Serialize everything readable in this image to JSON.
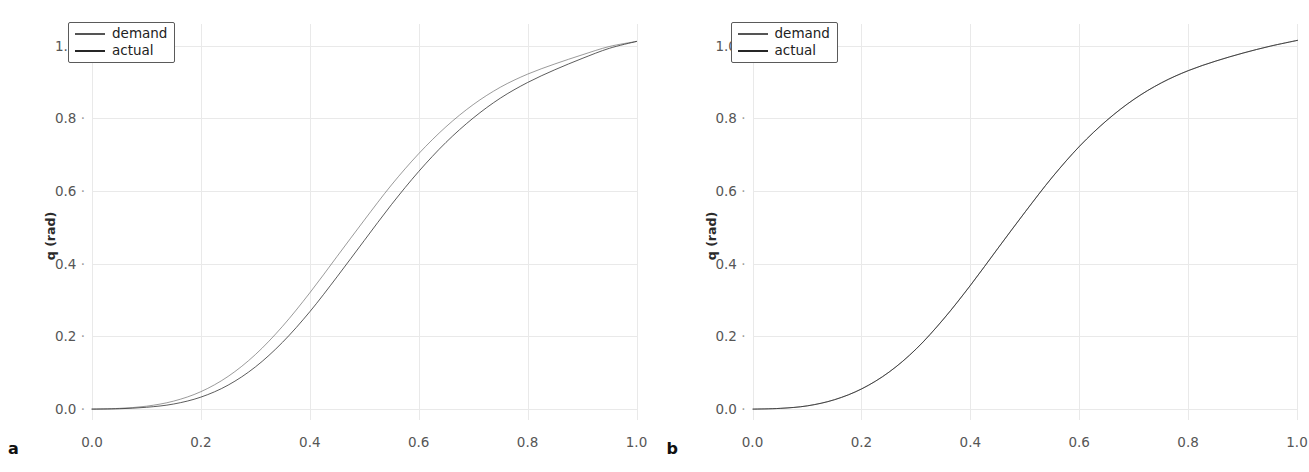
{
  "figure": {
    "clipped_header_text": "",
    "panels": [
      {
        "tag": "a",
        "ylabel": "q (rad)",
        "legend": [
          {
            "label": "demand",
            "color": "#555555",
            "width": 2.0
          },
          {
            "label": "actual",
            "color": "#262626",
            "width": 2.6
          }
        ],
        "yticks": [
          "0.0",
          "0.2",
          "0.4",
          "0.6",
          "0.8",
          "1.0"
        ],
        "xticks": [
          "0.0",
          "0.2",
          "0.4",
          "0.6",
          "0.8",
          "1.0"
        ]
      },
      {
        "tag": "b",
        "ylabel": "q (rad)",
        "legend": [
          {
            "label": "demand",
            "color": "#555555",
            "width": 2.0
          },
          {
            "label": "actual",
            "color": "#262626",
            "width": 2.6
          }
        ],
        "yticks": [
          "0.0",
          "0.2",
          "0.4",
          "0.6",
          "0.8",
          "1.0"
        ],
        "xticks": [
          "0.0",
          "0.2",
          "0.4",
          "0.6",
          "0.8",
          "1.0"
        ]
      }
    ]
  },
  "chart_data": [
    {
      "type": "line",
      "title": "",
      "panel": "a",
      "xlabel": "",
      "ylabel": "q (rad)",
      "xlim": [
        0.0,
        1.0
      ],
      "ylim": [
        -0.03,
        1.06
      ],
      "grid": true,
      "legend_position": "upper-left",
      "xticks": [
        0.0,
        0.2,
        0.4,
        0.6,
        0.8,
        1.0
      ],
      "yticks": [
        0.0,
        0.2,
        0.4,
        0.6,
        0.8,
        1.0
      ],
      "x": [
        0.0,
        0.05,
        0.1,
        0.15,
        0.2,
        0.25,
        0.3,
        0.35,
        0.4,
        0.45,
        0.5,
        0.55,
        0.6,
        0.65,
        0.7,
        0.75,
        0.8,
        0.85,
        0.9,
        0.95,
        1.0
      ],
      "series": [
        {
          "name": "demand",
          "color": "#555555",
          "values": [
            0.0,
            0.002,
            0.008,
            0.022,
            0.048,
            0.09,
            0.15,
            0.228,
            0.32,
            0.42,
            0.52,
            0.617,
            0.703,
            0.777,
            0.838,
            0.886,
            0.922,
            0.95,
            0.975,
            0.998,
            1.012
          ]
        },
        {
          "name": "actual",
          "color": "#262626",
          "values": [
            0.0,
            0.001,
            0.005,
            0.014,
            0.033,
            0.066,
            0.116,
            0.184,
            0.268,
            0.364,
            0.464,
            0.563,
            0.654,
            0.734,
            0.801,
            0.856,
            0.899,
            0.934,
            0.965,
            0.993,
            1.012
          ]
        }
      ]
    },
    {
      "type": "line",
      "title": "",
      "panel": "b",
      "xlabel": "",
      "ylabel": "q (rad)",
      "xlim": [
        0.0,
        1.0
      ],
      "ylim": [
        -0.03,
        1.06
      ],
      "grid": true,
      "legend_position": "upper-left",
      "xticks": [
        0.0,
        0.2,
        0.4,
        0.6,
        0.8,
        1.0
      ],
      "yticks": [
        0.0,
        0.2,
        0.4,
        0.6,
        0.8,
        1.0
      ],
      "x": [
        0.0,
        0.05,
        0.1,
        0.15,
        0.2,
        0.25,
        0.3,
        0.35,
        0.4,
        0.45,
        0.5,
        0.55,
        0.6,
        0.65,
        0.7,
        0.75,
        0.8,
        0.85,
        0.9,
        0.95,
        1.0
      ],
      "series": [
        {
          "name": "demand",
          "color": "#555555",
          "values": [
            0.0,
            0.002,
            0.009,
            0.026,
            0.056,
            0.102,
            0.166,
            0.248,
            0.342,
            0.443,
            0.543,
            0.639,
            0.724,
            0.795,
            0.853,
            0.898,
            0.932,
            0.958,
            0.98,
            0.999,
            1.015
          ]
        },
        {
          "name": "actual",
          "color": "#262626",
          "values": [
            0.0,
            0.002,
            0.009,
            0.026,
            0.056,
            0.102,
            0.166,
            0.248,
            0.342,
            0.443,
            0.543,
            0.639,
            0.724,
            0.795,
            0.853,
            0.898,
            0.932,
            0.958,
            0.98,
            0.999,
            1.015
          ]
        }
      ]
    }
  ]
}
